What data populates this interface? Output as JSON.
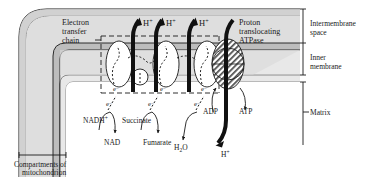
{
  "figure": {
    "type": "biological-schematic"
  },
  "labels": {
    "electron_transfer_chain": "Electron\ntransfer\nchain",
    "electron_transfer_chain_l1": "Electron",
    "electron_transfer_chain_l2": "transfer",
    "electron_transfer_chain_l3": "chain",
    "proton_atpase_l1": "Proton",
    "proton_atpase_l2": "translocating",
    "proton_atpase_l3": "ATPase",
    "intermembrane_space_l1": "Intermembrane",
    "intermembrane_space_l2": "space",
    "inner_membrane_l1": "Inner",
    "inner_membrane_l2": "membrane",
    "matrix": "Matrix",
    "compartments_l1": "Compartments of",
    "compartments_l2": "mitochondrion"
  },
  "protons": {
    "pumped": [
      {
        "id": "h-plus-1",
        "text": "H",
        "charge": "+"
      },
      {
        "id": "h-plus-2",
        "text": "H",
        "charge": "+"
      },
      {
        "id": "h-plus-3",
        "text": "H",
        "charge": "+"
      }
    ],
    "returning": {
      "id": "h-plus-atpase",
      "text": "H",
      "charge": "+"
    }
  },
  "electrons": [
    {
      "id": "electron-1",
      "text": "e",
      "charge": "–"
    },
    {
      "id": "electron-2",
      "text": "e",
      "charge": "–"
    },
    {
      "id": "electron-3",
      "text": "e",
      "charge": "–"
    },
    {
      "id": "electron-4",
      "text": "e",
      "charge": "–"
    },
    {
      "id": "electron-5",
      "text": "e",
      "charge": "–"
    },
    {
      "id": "electron-6",
      "text": "e",
      "charge": "–"
    }
  ],
  "substrates": {
    "nadh": {
      "base": "NADH",
      "sup": "+"
    },
    "nad": "NAD",
    "succinate": "Succinate",
    "fumarate": "Fumarate",
    "water": {
      "base": "H",
      "sub": "2",
      "tail": "O"
    },
    "adp": "ADP",
    "atp": "ATP"
  },
  "colors": {
    "outer_membrane_fill": "#c9c9c9",
    "intermembrane_fill": "#dedede",
    "inner_membrane_fill": "#d2d2d2",
    "matrix_fill": "#ffffff",
    "complex_fill": "#ffffff",
    "atpase_hatch": "#4a4a4a",
    "stroke": "#1a1a1a",
    "text": "#1a1a1a"
  }
}
